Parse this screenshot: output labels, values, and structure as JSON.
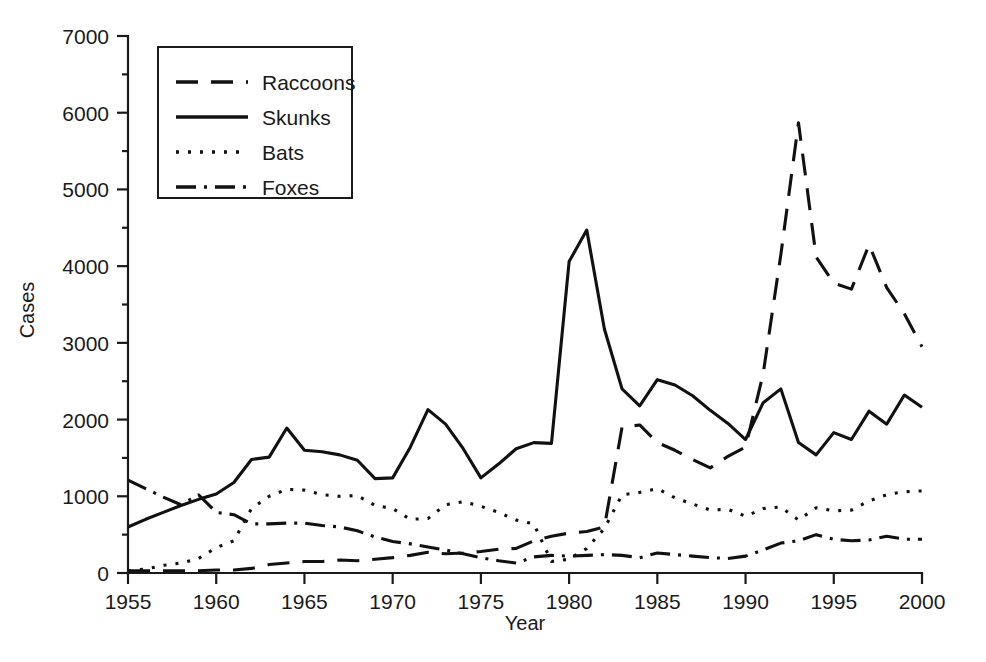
{
  "chart_data": {
    "type": "line",
    "title": "",
    "xlabel": "Year",
    "ylabel": "Cases",
    "xlim": [
      1955,
      2000
    ],
    "ylim": [
      0,
      7000
    ],
    "grid": false,
    "legend_position": "top-left",
    "x_ticks": [
      "1955",
      "1960",
      "1965",
      "1970",
      "1975",
      "1980",
      "1985",
      "1990",
      "1995",
      "2000"
    ],
    "x_tick_values": [
      1955,
      1960,
      1965,
      1970,
      1975,
      1980,
      1985,
      1990,
      1995,
      2000
    ],
    "y_ticks": [
      "0",
      "1000",
      "2000",
      "3000",
      "4000",
      "5000",
      "6000",
      "7000"
    ],
    "y_tick_values": [
      0,
      1000,
      2000,
      3000,
      4000,
      5000,
      6000,
      7000
    ],
    "x": [
      1955,
      1956,
      1957,
      1958,
      1959,
      1960,
      1961,
      1962,
      1963,
      1964,
      1965,
      1966,
      1967,
      1968,
      1969,
      1970,
      1971,
      1972,
      1973,
      1974,
      1975,
      1976,
      1977,
      1978,
      1979,
      1980,
      1981,
      1982,
      1983,
      1984,
      1985,
      1986,
      1987,
      1988,
      1989,
      1990,
      1991,
      1992,
      1993,
      1994,
      1995,
      1996,
      1997,
      1998,
      1999,
      2000
    ],
    "series": [
      {
        "name": "Raccoons",
        "dash": "22,13",
        "values": [
          30,
          30,
          30,
          30,
          30,
          40,
          40,
          60,
          110,
          130,
          150,
          150,
          170,
          160,
          180,
          200,
          230,
          270,
          250,
          260,
          280,
          310,
          320,
          420,
          480,
          520,
          540,
          600,
          1900,
          1930,
          1700,
          1600,
          1480,
          1370,
          1520,
          1640,
          2600,
          4150,
          5870,
          4120,
          3780,
          3700,
          4280,
          3720,
          3380,
          2950
        ]
      },
      {
        "name": "Skunks",
        "dash": "none",
        "values": [
          600,
          700,
          790,
          880,
          960,
          1030,
          1180,
          1480,
          1510,
          1890,
          1600,
          1580,
          1540,
          1470,
          1230,
          1240,
          1640,
          2130,
          1940,
          1620,
          1240,
          1420,
          1620,
          1700,
          1690,
          4060,
          4470,
          3180,
          2400,
          2180,
          2520,
          2450,
          2310,
          2120,
          1950,
          1740,
          2220,
          2400,
          1700,
          1540,
          1830,
          1740,
          2110,
          1940,
          2320,
          2160
        ]
      },
      {
        "name": "Bats",
        "dash": "3,9",
        "values": [
          30,
          50,
          100,
          130,
          190,
          330,
          420,
          840,
          1000,
          1090,
          1080,
          1020,
          1000,
          1010,
          880,
          840,
          700,
          710,
          890,
          930,
          870,
          790,
          690,
          640,
          150,
          180,
          320,
          580,
          1020,
          1050,
          1100,
          980,
          900,
          820,
          830,
          740,
          840,
          860,
          690,
          850,
          810,
          820,
          940,
          1020,
          1060,
          1070
        ]
      },
      {
        "name": "Foxes",
        "dash": "20,8,3,8",
        "values": [
          1210,
          1100,
          990,
          890,
          1020,
          790,
          760,
          640,
          640,
          650,
          650,
          620,
          600,
          550,
          470,
          410,
          380,
          340,
          300,
          250,
          200,
          160,
          130,
          210,
          230,
          220,
          230,
          240,
          230,
          200,
          260,
          240,
          220,
          200,
          190,
          220,
          300,
          390,
          420,
          500,
          440,
          420,
          430,
          480,
          440,
          440
        ]
      }
    ]
  },
  "legend": {
    "entries": [
      {
        "label": "Raccoons"
      },
      {
        "label": "Skunks"
      },
      {
        "label": "Bats"
      },
      {
        "label": "Foxes"
      }
    ]
  }
}
